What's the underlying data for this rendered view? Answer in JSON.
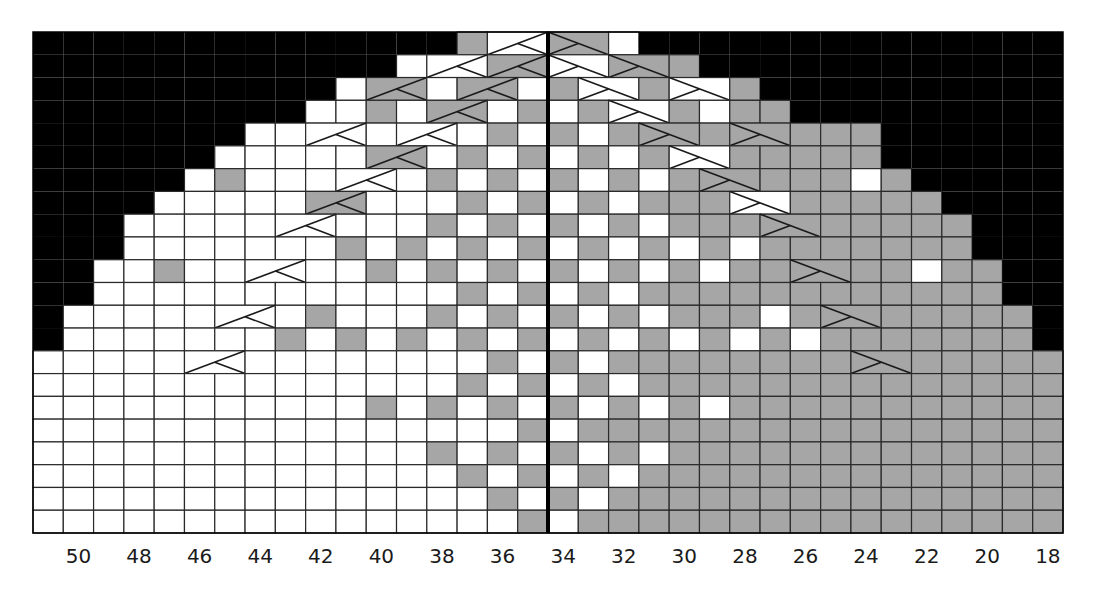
{
  "chart": {
    "colors": {
      "no_stitch": "#000000",
      "contrast": "#a6a6a6",
      "main": "#ffffff",
      "grid_line": "#2a2a2a",
      "center_line": "#000000"
    },
    "legend_codes": {
      "X": "no stitch (black)",
      ".": "main color (white)",
      "#": "contrast color (gray)"
    },
    "grid": {
      "columns": 34,
      "rows": 22,
      "first_column_number": 51,
      "last_column_number": 18,
      "center_line_after_column_index": 16
    },
    "rows": [
      "XXXXXXXXXXXXXX#..##.XXXXXXXXXXXXXX",
      "XXXXXXXXXXXX...##..###XXXXXXXXXXXX",
      "XXXXXXXXXX.##.##.#..#..#XXXXXXXXXX",
      "XXXXXXXXX..#.##.#.#..#.##XXXXXXXXX",
      "XXXXXXX........#.#.#########XXXXXXX",
      "XXXXXX.....##.#.#.#.#..#####XXXXXX",
      "XXXXX.#......#.#.#.#.######.#XXXXX",
      "XXXX.....##...#.#.#.###..#####XXXX",
      "XXX..........#.#.#.#.##########XXX",
      "XXX.......#.#.#.#.#.#.#.#######XXX",
      "XX..#......#.#.#.#.#.#.######.##XX",
      "XX............#.#.#.############XX",
      "X........#...#.#.#.#.###.########X",
      "X.......#.#.#.#.#.#.#.#.#.#######X",
      "...............#.#.###############",
      "..............#.#.#.##############",
      "...........#.#.#.#.#.#.###########",
      "................#.################",
      ".............#.#.#.#.#############",
      "..............#.#.#.##############",
      "...............#.#.###############",
      "................#.################"
    ],
    "cables": [
      {
        "row": 0,
        "col": 15,
        "dir": "left"
      },
      {
        "row": 0,
        "col": 17,
        "dir": "right"
      },
      {
        "row": 1,
        "col": 13,
        "dir": "left"
      },
      {
        "row": 1,
        "col": 15,
        "dir": "left"
      },
      {
        "row": 1,
        "col": 17,
        "dir": "right"
      },
      {
        "row": 1,
        "col": 19,
        "dir": "right"
      },
      {
        "row": 2,
        "col": 11,
        "dir": "left"
      },
      {
        "row": 2,
        "col": 14,
        "dir": "left"
      },
      {
        "row": 2,
        "col": 18,
        "dir": "right"
      },
      {
        "row": 2,
        "col": 21,
        "dir": "right"
      },
      {
        "row": 3,
        "col": 13,
        "dir": "left"
      },
      {
        "row": 3,
        "col": 19,
        "dir": "right"
      },
      {
        "row": 4,
        "col": 9,
        "dir": "left"
      },
      {
        "row": 4,
        "col": 12,
        "dir": "left"
      },
      {
        "row": 4,
        "col": 20,
        "dir": "right"
      },
      {
        "row": 4,
        "col": 23,
        "dir": "right"
      },
      {
        "row": 5,
        "col": 11,
        "dir": "left"
      },
      {
        "row": 5,
        "col": 21,
        "dir": "right"
      },
      {
        "row": 6,
        "col": 10,
        "dir": "left"
      },
      {
        "row": 6,
        "col": 22,
        "dir": "right"
      },
      {
        "row": 7,
        "col": 9,
        "dir": "left"
      },
      {
        "row": 7,
        "col": 23,
        "dir": "right"
      },
      {
        "row": 8,
        "col": 8,
        "dir": "left"
      },
      {
        "row": 8,
        "col": 24,
        "dir": "right"
      },
      {
        "row": 10,
        "col": 7,
        "dir": "left"
      },
      {
        "row": 10,
        "col": 25,
        "dir": "right"
      },
      {
        "row": 12,
        "col": 6,
        "dir": "left"
      },
      {
        "row": 12,
        "col": 26,
        "dir": "right"
      },
      {
        "row": 14,
        "col": 5,
        "dir": "left"
      },
      {
        "row": 14,
        "col": 27,
        "dir": "right"
      }
    ],
    "x_axis_labels": [
      "50",
      "48",
      "46",
      "44",
      "42",
      "40",
      "38",
      "36",
      "34",
      "32",
      "30",
      "28",
      "26",
      "24",
      "22",
      "20",
      "18"
    ],
    "x_axis_label_column_indices": [
      1,
      3,
      5,
      7,
      9,
      11,
      13,
      15,
      17,
      19,
      21,
      23,
      25,
      27,
      29,
      31,
      33
    ]
  },
  "chart_data": {
    "type": "heatmap",
    "title": "",
    "xlabel": "stitch number",
    "ylabel": "",
    "x_tick_labels": [
      "50",
      "48",
      "46",
      "44",
      "42",
      "40",
      "38",
      "36",
      "34",
      "32",
      "30",
      "28",
      "26",
      "24",
      "22",
      "20",
      "18"
    ],
    "columns_from_left": [
      51,
      50,
      49,
      48,
      47,
      46,
      45,
      44,
      43,
      42,
      41,
      40,
      39,
      38,
      37,
      36,
      35,
      34,
      33,
      32,
      31,
      30,
      29,
      28,
      27,
      26,
      25,
      24,
      23,
      22,
      21,
      20,
      19,
      18
    ],
    "row_count": 22,
    "cell_states": [
      "no stitch",
      "main color (white)",
      "contrast color (gray)"
    ],
    "cable_crosses": 30,
    "grid": true,
    "legend": "none"
  }
}
